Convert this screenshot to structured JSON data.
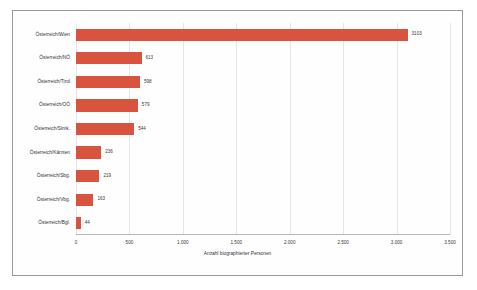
{
  "chart_data": {
    "type": "bar",
    "orientation": "horizontal",
    "title": "",
    "xlabel": "Anzahl biographierter Personen",
    "ylabel": "",
    "xlim": [
      0,
      3500
    ],
    "grid": true,
    "legend": false,
    "bar_color": "#d9543e",
    "xticks": [
      "0",
      "500",
      "1.000",
      "1.500",
      "2.000",
      "2.500",
      "3.000",
      "3.500"
    ],
    "xtick_values": [
      0,
      500,
      1000,
      1500,
      2000,
      2500,
      3000,
      3500
    ],
    "categories": [
      "Österreich/Wien",
      "Österreich/NÖ",
      "Österreich/Tirol",
      "Österreich/OÖ",
      "Österreich/Stmk.",
      "Österreich/Kärnten",
      "Österreich/Sbg.",
      "Österreich/Vbg.",
      "Österreich/Bgl."
    ],
    "values": [
      3103,
      613,
      598,
      579,
      544,
      236,
      219,
      163,
      44
    ],
    "value_labels": [
      "3103",
      "613",
      "598",
      "579",
      "544",
      "236",
      "219",
      "163",
      "44"
    ]
  }
}
